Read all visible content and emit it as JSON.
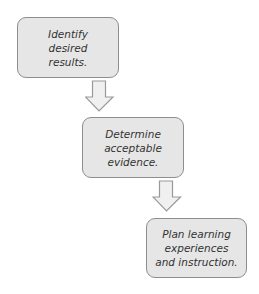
{
  "diagram": {
    "type": "flowchart",
    "direction": "top-left to bottom-right",
    "colors": {
      "box_fill": "#e6e6e6",
      "box_border": "#8e8e8e",
      "arrow_fill": "#f0f0f0",
      "arrow_stroke": "#999999",
      "text": "#333333"
    },
    "steps": [
      {
        "id": "step-1",
        "label": "Identify\ndesired\nresults."
      },
      {
        "id": "step-2",
        "label": "Determine\nacceptable\nevidence."
      },
      {
        "id": "step-3",
        "label": "Plan learning\nexperiences\nand instruction."
      }
    ],
    "connectors": [
      {
        "from": "step-1",
        "to": "step-2",
        "icon": "down-arrow-icon"
      },
      {
        "from": "step-2",
        "to": "step-3",
        "icon": "down-arrow-icon"
      }
    ]
  }
}
